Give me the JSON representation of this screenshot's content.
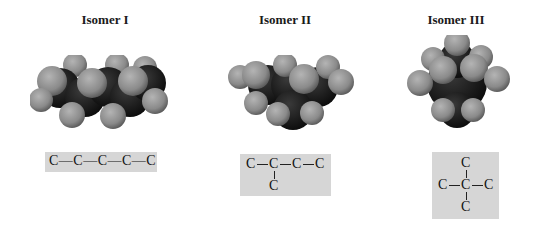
{
  "isomers": [
    {
      "title": "Isomer I",
      "structure": "straight-chain",
      "formula_atoms": [
        "C",
        "C",
        "C",
        "C",
        "C"
      ],
      "formula_text": "C—C—C—C—C"
    },
    {
      "title": "Isomer II",
      "structure": "branched",
      "formula_atoms": [
        "C",
        "C",
        "C",
        "C",
        "C"
      ],
      "formula_text": "C—C—C—C with C branch on second carbon"
    },
    {
      "title": "Isomer III",
      "structure": "quaternary",
      "formula_atoms": [
        "C",
        "C",
        "C",
        "C",
        "C"
      ],
      "formula_text": "central C bonded to four C"
    }
  ],
  "colors": {
    "carbon": "#1c1c1c",
    "hydrogen": "#8c8c8c",
    "formula_box": "#d6d6d6"
  }
}
